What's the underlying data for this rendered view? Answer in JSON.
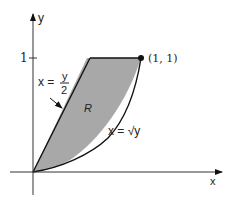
{
  "diagram": {
    "axes": {
      "x_label": "x",
      "y_label": "y",
      "y_tick_label": "1"
    },
    "region": {
      "label": "R",
      "fill": "#a8a8a8",
      "stroke": "#111111"
    },
    "curves": {
      "line_label_lhs": "x =",
      "line_label_num": "y",
      "line_label_den": "2",
      "sqrt_label": "x = √y"
    },
    "point": {
      "label": "(1, 1)"
    }
  }
}
